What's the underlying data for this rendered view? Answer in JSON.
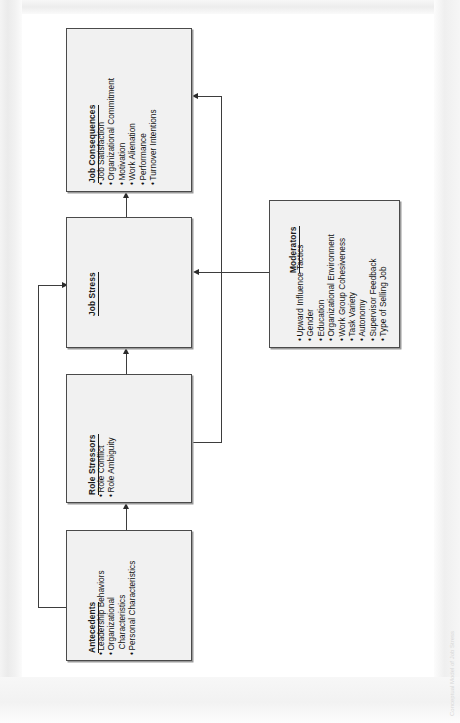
{
  "diagram": {
    "title": "Conceptual Model of Job Stress",
    "orientation": "rotated-90-ccw",
    "boxes": [
      {
        "id": "job-consequences",
        "title": "Job Consequences",
        "items": [
          "Job Satisfaction",
          "Organizational Commitment",
          "Motivation",
          "Work Alienation",
          "Performance",
          "Turnover Intentions"
        ]
      },
      {
        "id": "job-stress",
        "title": "Job Stress",
        "items": []
      },
      {
        "id": "role-stressors",
        "title": "Role Stressors",
        "items": [
          "Role Conflict",
          "Role Ambiguity"
        ]
      },
      {
        "id": "antecedents",
        "title": "Antecedents",
        "items": [
          "Leadership Behaviors",
          "Organizational",
          "Characteristics",
          "Personal Characteristics"
        ]
      },
      {
        "id": "moderators",
        "title": "Moderators",
        "items": [
          "Upward Influence Tactics",
          "Gender",
          "Education",
          "Organizational Environment",
          "Work Group Cohesiveness",
          "Task Variety",
          "Autonomy",
          "Supervisor Feedback",
          "Type of Selling Job"
        ]
      }
    ],
    "connections": [
      {
        "from": "antecedents",
        "to": "role-stressors",
        "style": "arrow"
      },
      {
        "from": "antecedents",
        "to": "job-stress",
        "style": "arrow"
      },
      {
        "from": "role-stressors",
        "to": "job-stress",
        "style": "arrow"
      },
      {
        "from": "role-stressors",
        "to": "job-consequences",
        "style": "arrow"
      },
      {
        "from": "job-stress",
        "to": "job-consequences",
        "style": "arrow"
      },
      {
        "from": "moderators",
        "to": "job-stress",
        "style": "arrow"
      }
    ],
    "bullet_glyph": "•",
    "colors": {
      "box_fill": "#f1f1f1",
      "box_border": "#4a4a4a",
      "line": "#3d3d3d",
      "text": "#111111",
      "page": "#ffffff"
    }
  }
}
